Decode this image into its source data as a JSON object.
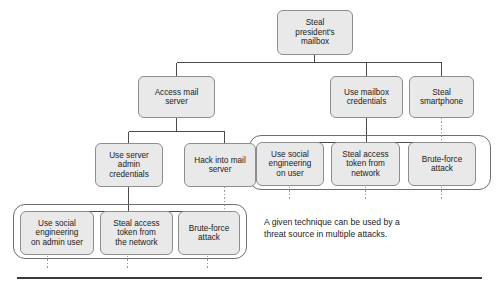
{
  "figure": {
    "type": "attack-tree-diagram",
    "background_color": "#ffffff",
    "node_fill": "#e9e9e9",
    "node_border": "#8d8d8d",
    "group_border": "#6e6e6e",
    "connector_color": "#4a4a4a",
    "rule_color": "#3a3a3a"
  },
  "nodes": {
    "root": "Steal\npresident's\nmailbox",
    "access_mail_server": "Access mail\nserver",
    "use_mailbox_credentials": "Use mailbox\ncredentials",
    "steal_smartphone": "Steal\nsmartphone",
    "use_server_admin_credentials": "Use server\nadmin\ncredentials",
    "hack_into_mail_server": "Hack into mail\nserver",
    "right_group": {
      "social_engineering_user": "Use social\nengineering\non user",
      "steal_access_token_network": "Steal access\ntoken from\nnetwork",
      "brute_force_attack": "Brute-force\nattack"
    },
    "left_group": {
      "social_engineering_admin_user": "Use social\nengineering\non admin user",
      "steal_access_token_the_network": "Steal access\ntoken from\nthe network",
      "brute_force_attack": "Brute-force\nattack"
    }
  },
  "caption": {
    "text": "A given technique can be used by a\nthreat source in multiple attacks."
  }
}
